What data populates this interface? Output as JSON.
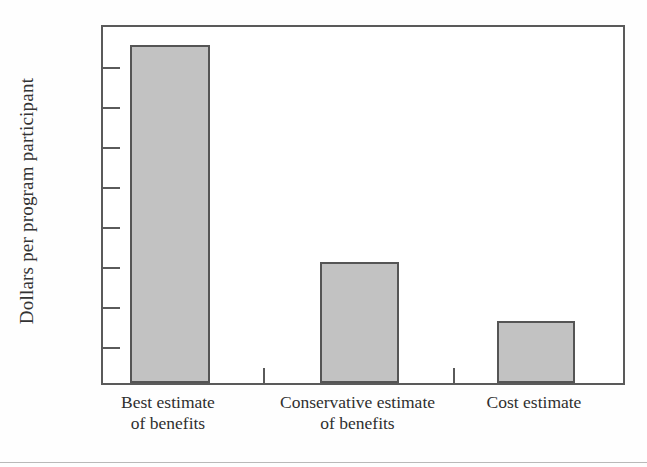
{
  "chart_data": {
    "type": "bar",
    "title": "",
    "subtitle": "",
    "xlabel": "",
    "ylabel": "Dollars per program participant",
    "categories": [
      "Best estimate of benefits",
      "Conservative estimate of benefits",
      "Cost estimate"
    ],
    "category_lines": [
      [
        "Best estimate",
        "of benefits"
      ],
      [
        "Conservative estimate",
        "of benefits"
      ],
      [
        "Cost estimate",
        ""
      ]
    ],
    "values": [
      845,
      303,
      155
    ],
    "ylim": [
      0,
      900
    ],
    "ytick_values": [
      0,
      100,
      200,
      300,
      400,
      500,
      600,
      700,
      800,
      900
    ],
    "ytick_labels": [
      "0",
      "100",
      "200",
      "300",
      "400",
      "500",
      "600",
      "700",
      "800",
      "900"
    ],
    "grid": false,
    "legend": null,
    "bar_fill_color": "#c2c2c2",
    "bar_border_color": "#555555",
    "axis_color": "#5a5a5a",
    "background_color": "#ffffff"
  }
}
